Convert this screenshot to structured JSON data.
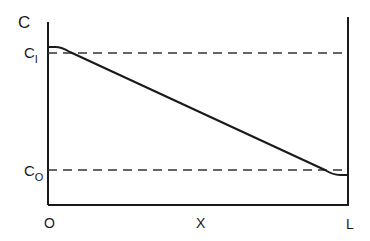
{
  "diagram": {
    "type": "concentration-profile",
    "y_axis_label": "C",
    "x_axis_label": "X",
    "x_origin_label": "O",
    "x_end_label": "L",
    "levels": [
      {
        "name": "C1",
        "main": "C",
        "sub": "I"
      },
      {
        "name": "C0",
        "main": "C",
        "sub": "O"
      }
    ],
    "curve_description": "Linear decrease from slightly above C1 at x=0 to slightly below C0 at x=L, with flattened ends",
    "colors": {
      "line": "#1a1a1a",
      "background": "#ffffff"
    }
  }
}
